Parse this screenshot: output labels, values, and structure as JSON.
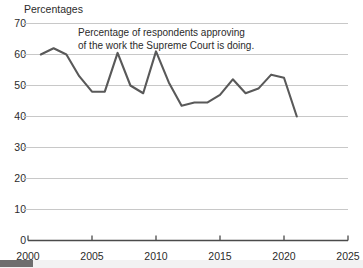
{
  "chart_data": {
    "type": "line",
    "title": "",
    "ylabel": "Percentages",
    "xlabel": "",
    "annotation": {
      "line1": "Percentage of respondents approving",
      "line2": "of the work the Supreme Court is doing."
    },
    "ylim": [
      0,
      70
    ],
    "xlim": [
      2000,
      2025
    ],
    "yticks": [
      0,
      10,
      20,
      30,
      40,
      50,
      60,
      70
    ],
    "ytick_labels": [
      "0",
      "10",
      "20",
      "30",
      "40",
      "50",
      "60",
      "70"
    ],
    "xticks": [
      2000,
      2005,
      2010,
      2015,
      2020,
      2025
    ],
    "xtick_labels": [
      "2000",
      "2005",
      "2010",
      "2015",
      "2020",
      "2025"
    ],
    "grid": true,
    "legend": "none",
    "line_color": "#595959",
    "grid_color": "#c8c8c8",
    "axis_color": "#4a4a4a",
    "x": [
      2001,
      2002,
      2003,
      2004,
      2005,
      2006,
      2007,
      2008,
      2009,
      2010,
      2011,
      2012,
      2013,
      2014,
      2015,
      2016,
      2017,
      2018,
      2019,
      2020,
      2021
    ],
    "values": [
      60,
      62,
      60,
      53,
      48,
      48,
      60.5,
      50,
      47.5,
      61,
      51,
      43.5,
      44.5,
      44.5,
      47,
      52,
      47.5,
      49,
      53.5,
      52.5,
      40
    ],
    "series": [
      {
        "name": "Supreme Court approval",
        "values": [
          60,
          62,
          60,
          53,
          48,
          48,
          60.5,
          50,
          47.5,
          61,
          51,
          43.5,
          44.5,
          44.5,
          47,
          52,
          47.5,
          49,
          53.5,
          52.5,
          40
        ]
      }
    ]
  }
}
